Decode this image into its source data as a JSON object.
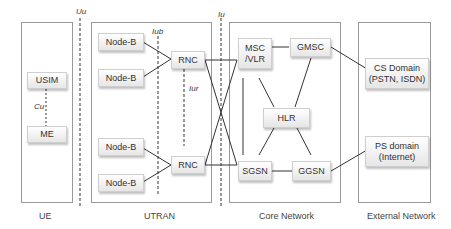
{
  "regions": [
    {
      "id": "ue",
      "label": "UE"
    },
    {
      "id": "utran",
      "label": "UTRAN"
    },
    {
      "id": "core",
      "label": "Core Network"
    },
    {
      "id": "external",
      "label": "External Network"
    }
  ],
  "interfaces": {
    "uu": "Uu",
    "iub": "Iub",
    "iur": "Iur",
    "iu": "Iu",
    "cu": "Cu"
  },
  "nodes": {
    "usim": "USIM",
    "me": "ME",
    "nodeb1": "Node-B",
    "nodeb2": "Node-B",
    "nodeb3": "Node-B",
    "nodeb4": "Node-B",
    "rnc1": "RNC",
    "rnc2": "RNC",
    "msc_vlr": "MSC\n/VLR",
    "gmsc": "GMSC",
    "hlr": "HLR",
    "sgsn": "SGSN",
    "ggsn": "GGSN",
    "cs_domain": "CS Domain\n(PSTN, ISDN)",
    "ps_domain": "PS domain\n(Internet)"
  },
  "colors": {
    "region_border": "#9a9a9a",
    "line": "#333333",
    "node_fill_top": "#ffffff",
    "node_fill_bottom": "#e6e6e6"
  }
}
